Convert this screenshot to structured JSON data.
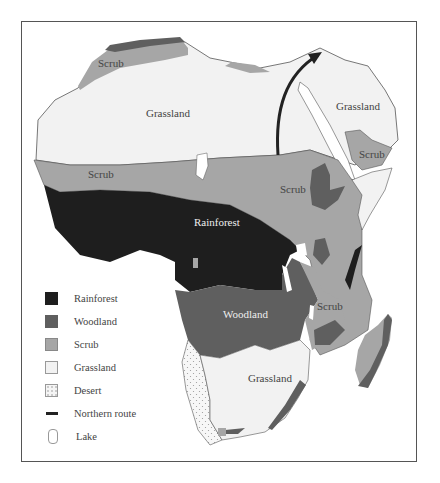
{
  "map": {
    "subject": "Africa vegetation zones",
    "region_labels": {
      "scrub_north": "Scrub",
      "grassland_north": "Grassland",
      "grassland_northeast": "Grassland",
      "scrub_hornofafrica": "Scrub",
      "scrub_sahel": "Scrub",
      "scrub_east": "Scrub",
      "rainforest": "Rainforest",
      "woodland": "Woodland",
      "scrub_southeast": "Scrub",
      "grassland_south": "Grassland"
    },
    "colors": {
      "rainforest": "#1e1e1e",
      "woodland": "#5f5f5f",
      "scrub": "#a6a6a6",
      "grassland": "#f2f2f2",
      "desert": "#f5f5f5",
      "route": "#222222",
      "lake": "#ffffff",
      "outline": "#555555"
    }
  },
  "legend": {
    "items": [
      {
        "key": "rainforest",
        "label": "Rainforest"
      },
      {
        "key": "woodland",
        "label": "Woodland"
      },
      {
        "key": "scrub",
        "label": "Scrub"
      },
      {
        "key": "grassland",
        "label": "Grassland"
      },
      {
        "key": "desert",
        "label": "Desert"
      },
      {
        "key": "route",
        "label": "Northern route"
      },
      {
        "key": "lake",
        "label": "Lake"
      }
    ]
  }
}
